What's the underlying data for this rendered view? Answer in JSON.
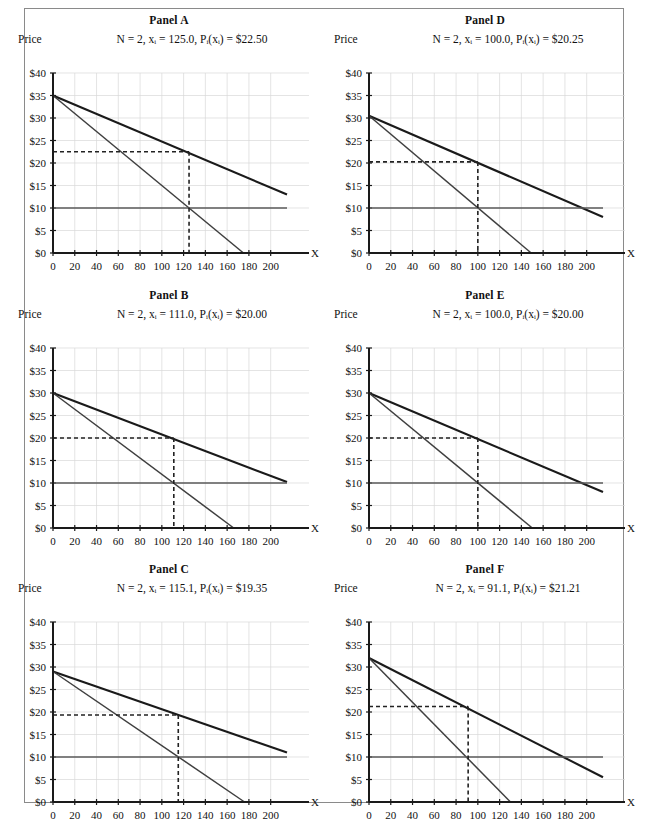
{
  "figure": {
    "y_axis_label": "Price",
    "x_axis_label": "X",
    "y_ticks": [
      "$40",
      "$35",
      "$30",
      "$25",
      "$20",
      "$15",
      "$10",
      "$5",
      "$0"
    ],
    "x_ticks": [
      "0",
      "20",
      "40",
      "60",
      "80",
      "100",
      "120",
      "140",
      "160",
      "180",
      "200"
    ],
    "y_range": [
      0,
      40
    ],
    "x_range": [
      0,
      215
    ],
    "marginal_cost": 10,
    "colors": {
      "frame": "#8a8a8a",
      "grid": "#d9d9d9",
      "axis": "#1a1a1a",
      "demand": "#1a1a1a",
      "marginal_revenue": "#3f3f3f",
      "marginal_cost": "#5a5a5a",
      "guide_dashed": "#222222",
      "background": "#ffffff"
    }
  },
  "chart_data": [
    {
      "type": "line",
      "title": "Panel A",
      "subtitle": "N = 2, xᵢ = 125.0, Pᵢ(xᵢ) = $22.50",
      "xlabel": "X",
      "ylabel": "Price",
      "xlim": [
        0,
        215
      ],
      "ylim": [
        0,
        40
      ],
      "grid": true,
      "legend": "none",
      "annotations": {
        "N": 2,
        "x_i": 125.0,
        "P_i": 22.5
      },
      "series": [
        {
          "name": "Demand",
          "x": [
            0,
            215
          ],
          "y": [
            35.0,
            13.0
          ]
        },
        {
          "name": "Marginal Revenue",
          "x": [
            0,
            175
          ],
          "y": [
            35.0,
            0
          ]
        },
        {
          "name": "Marginal Cost",
          "x": [
            0,
            215
          ],
          "y": [
            10.0,
            10.0
          ]
        }
      ],
      "guides": {
        "x": 125.0,
        "y": 22.5
      }
    },
    {
      "type": "line",
      "title": "Panel D",
      "subtitle": "N = 2, xᵢ = 100.0, Pᵢ(xᵢ) = $20.25",
      "xlabel": "X",
      "ylabel": "Price",
      "xlim": [
        0,
        215
      ],
      "ylim": [
        0,
        40
      ],
      "grid": true,
      "legend": "none",
      "annotations": {
        "N": 2,
        "x_i": 100.0,
        "P_i": 20.25
      },
      "series": [
        {
          "name": "Demand",
          "x": [
            0,
            215
          ],
          "y": [
            30.5,
            8.0
          ]
        },
        {
          "name": "Marginal Revenue",
          "x": [
            0,
            149
          ],
          "y": [
            30.5,
            0
          ]
        },
        {
          "name": "Marginal Cost",
          "x": [
            0,
            215
          ],
          "y": [
            10.0,
            10.0
          ]
        }
      ],
      "guides": {
        "x": 100.0,
        "y": 20.25
      }
    },
    {
      "type": "line",
      "title": "Panel B",
      "subtitle": "N = 2, xᵢ = 111.0, Pᵢ(xᵢ) = $20.00",
      "xlabel": "X",
      "ylabel": "Price",
      "xlim": [
        0,
        215
      ],
      "ylim": [
        0,
        40
      ],
      "grid": true,
      "legend": "none",
      "annotations": {
        "N": 2,
        "x_i": 111.0,
        "P_i": 20.0
      },
      "series": [
        {
          "name": "Demand",
          "x": [
            0,
            215
          ],
          "y": [
            30.0,
            10.2
          ]
        },
        {
          "name": "Marginal Revenue",
          "x": [
            0,
            166
          ],
          "y": [
            30.0,
            0
          ]
        },
        {
          "name": "Marginal Cost",
          "x": [
            0,
            215
          ],
          "y": [
            10.0,
            10.0
          ]
        }
      ],
      "guides": {
        "x": 111.0,
        "y": 20.0
      }
    },
    {
      "type": "line",
      "title": "Panel E",
      "subtitle": "N = 2, xᵢ = 100.0, Pᵢ(xᵢ) = $20.00",
      "xlabel": "X",
      "ylabel": "Price",
      "xlim": [
        0,
        215
      ],
      "ylim": [
        0,
        40
      ],
      "grid": true,
      "legend": "none",
      "annotations": {
        "N": 2,
        "x_i": 100.0,
        "P_i": 20.0
      },
      "series": [
        {
          "name": "Demand",
          "x": [
            0,
            215
          ],
          "y": [
            30.0,
            8.0
          ]
        },
        {
          "name": "Marginal Revenue",
          "x": [
            0,
            150
          ],
          "y": [
            30.0,
            0
          ]
        },
        {
          "name": "Marginal Cost",
          "x": [
            0,
            215
          ],
          "y": [
            10.0,
            10.0
          ]
        }
      ],
      "guides": {
        "x": 100.0,
        "y": 20.0
      }
    },
    {
      "type": "line",
      "title": "Panel C",
      "subtitle": "N = 2, xᵢ = 115.1, Pᵢ(xᵢ) = $19.35",
      "xlabel": "X",
      "ylabel": "Price",
      "xlim": [
        0,
        215
      ],
      "ylim": [
        0,
        40
      ],
      "grid": true,
      "legend": "none",
      "annotations": {
        "N": 2,
        "x_i": 115.1,
        "P_i": 19.35
      },
      "series": [
        {
          "name": "Demand",
          "x": [
            0,
            215
          ],
          "y": [
            29.0,
            11.0
          ]
        },
        {
          "name": "Marginal Revenue",
          "x": [
            0,
            176
          ],
          "y": [
            29.0,
            0
          ]
        },
        {
          "name": "Marginal Cost",
          "x": [
            0,
            215
          ],
          "y": [
            10.0,
            10.0
          ]
        }
      ],
      "guides": {
        "x": 115.1,
        "y": 19.35
      }
    },
    {
      "type": "line",
      "title": "Panel F",
      "subtitle": "N = 2, xᵢ = 91.1, Pᵢ(xᵢ) = $21.21",
      "xlabel": "X",
      "ylabel": "Price",
      "xlim": [
        0,
        215
      ],
      "ylim": [
        0,
        40
      ],
      "grid": true,
      "legend": "none",
      "annotations": {
        "N": 2,
        "x_i": 91.1,
        "P_i": 21.21
      },
      "series": [
        {
          "name": "Demand",
          "x": [
            0,
            215
          ],
          "y": [
            32.0,
            5.5
          ]
        },
        {
          "name": "Marginal Revenue",
          "x": [
            0,
            130
          ],
          "y": [
            32.0,
            0
          ]
        },
        {
          "name": "Marginal Cost",
          "x": [
            0,
            215
          ],
          "y": [
            10.0,
            10.0
          ]
        }
      ],
      "guides": {
        "x": 91.1,
        "y": 21.21
      }
    }
  ]
}
